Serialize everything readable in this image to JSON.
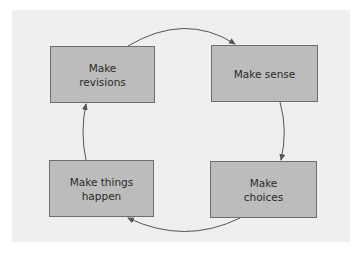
{
  "diagram": {
    "type": "cycle",
    "direction": "clockwise",
    "nodes": [
      {
        "id": "revisions",
        "label": "Make\nrevisions",
        "position": "top-left"
      },
      {
        "id": "sense",
        "label": "Make sense",
        "position": "top-right"
      },
      {
        "id": "choices",
        "label": "Make\nchoices",
        "position": "bottom-right"
      },
      {
        "id": "happen",
        "label": "Make things\nhappen",
        "position": "bottom-left"
      }
    ],
    "edges": [
      {
        "from": "revisions",
        "to": "sense"
      },
      {
        "from": "sense",
        "to": "choices"
      },
      {
        "from": "choices",
        "to": "happen"
      },
      {
        "from": "happen",
        "to": "revisions"
      }
    ],
    "colors": {
      "background": "#efefef",
      "node_fill": "#bcbcbc",
      "node_border": "#6e6e6e",
      "arrow": "#555555"
    }
  }
}
